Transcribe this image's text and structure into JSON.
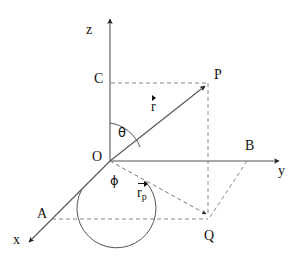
{
  "figure": {
    "background_color": "#ffffff",
    "line_color": "#555555",
    "text_color": "#111111",
    "dash_color": "#888888"
  },
  "axes": {
    "z": {
      "label": "z"
    },
    "y": {
      "label": "y"
    },
    "x": {
      "label": "x"
    }
  },
  "points": {
    "origin": {
      "label": "O"
    },
    "c": {
      "label": "C"
    },
    "p": {
      "label": "P"
    },
    "b": {
      "label": "B"
    },
    "a": {
      "label": "A"
    },
    "q": {
      "label": "Q"
    }
  },
  "angles": {
    "theta": {
      "label": "θ"
    },
    "phi": {
      "label": "ϕ"
    }
  },
  "vectors": {
    "r": {
      "base": "r",
      "subscript": ""
    },
    "rp": {
      "base": "r",
      "subscript": "p"
    }
  }
}
